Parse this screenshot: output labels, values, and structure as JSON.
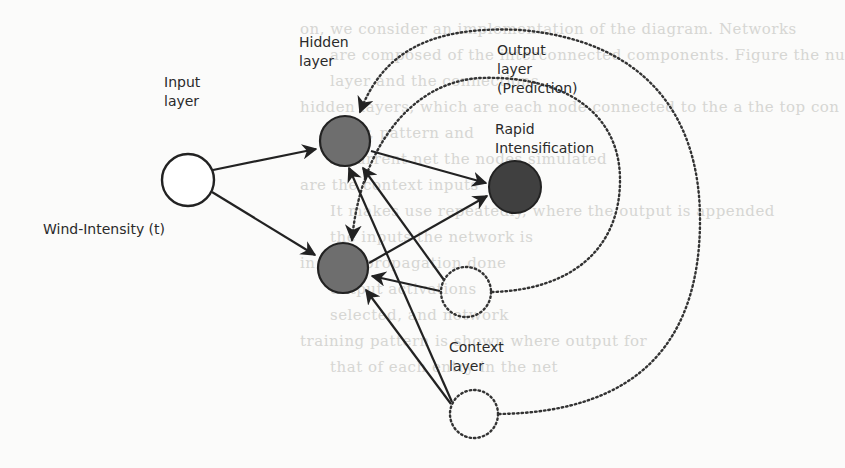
{
  "diagram": {
    "type": "recurrent-neural-network (Elman)",
    "colors": {
      "background": "#fbfbfa",
      "stroke": "#222222",
      "hidden_fill": "#6e6e6e",
      "output_fill": "#404040",
      "input_fill": "#ffffff"
    },
    "labels": {
      "input_layer": "Input\nlayer",
      "hidden_layer": "Hidden\nlayer",
      "output_layer": "Output\nlayer\n(Prediction)",
      "output_node": "Rapid\nIntensification",
      "input_node": "Wind-Intensity (t)",
      "context_layer": "Context\nlayer"
    },
    "nodes": [
      {
        "id": "input",
        "layer": "input",
        "cx": 188,
        "cy": 180,
        "r": 27
      },
      {
        "id": "hidden1",
        "layer": "hidden",
        "cx": 345,
        "cy": 141,
        "r": 26
      },
      {
        "id": "hidden2",
        "layer": "hidden",
        "cx": 343,
        "cy": 268,
        "r": 26
      },
      {
        "id": "output",
        "layer": "output",
        "cx": 515,
        "cy": 187,
        "r": 27
      },
      {
        "id": "context1",
        "layer": "context",
        "cx": 466,
        "cy": 292,
        "r": 26
      },
      {
        "id": "context2",
        "layer": "context",
        "cx": 474,
        "cy": 414,
        "r": 25
      }
    ],
    "edges": [
      {
        "from": "input",
        "to": "hidden1",
        "style": "solid"
      },
      {
        "from": "input",
        "to": "hidden2",
        "style": "solid"
      },
      {
        "from": "hidden1",
        "to": "output",
        "style": "solid"
      },
      {
        "from": "hidden2",
        "to": "output",
        "style": "solid"
      },
      {
        "from": "context1",
        "to": "hidden1",
        "style": "solid"
      },
      {
        "from": "context1",
        "to": "hidden2",
        "style": "solid"
      },
      {
        "from": "context2",
        "to": "hidden1",
        "style": "solid"
      },
      {
        "from": "context2",
        "to": "hidden2",
        "style": "solid"
      },
      {
        "from": "context1",
        "to": "hidden1",
        "style": "dotted-recurrent"
      },
      {
        "from": "context2",
        "to": "hidden2",
        "style": "dotted-recurrent"
      }
    ]
  },
  "background_text": [
    "on, we consider an implementation of the diagram. Networks",
    "are composed of the interconnected components. Figure the nu",
    "layer and the connections",
    "hidden layers, which are each node connected to the a the top con",
    "layer, pattern and",
    "recurrent net the nodes simulated",
    "are the context inputs",
    "It makes use repeatedly, where the output is appended",
    "the inputs the network is",
    "in back-propagation done",
    "output activations",
    "selected, and network",
    "training pattern is shown where output for",
    "that of each entry in the net"
  ]
}
